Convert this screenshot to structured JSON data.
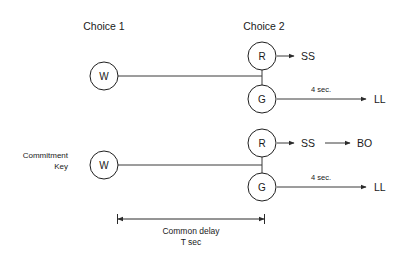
{
  "diagram": {
    "title_absent": true,
    "background_color": "#ffffff",
    "line_color": "#3b3b3b",
    "text_color": "#1a1a1a",
    "headers": {
      "choice1": "Choice 1",
      "choice2": "Choice 2"
    },
    "side_label": {
      "line1": "Commitment",
      "line2": "Key"
    },
    "nodes": {
      "w": "W",
      "r": "R",
      "g": "G"
    },
    "rows": [
      {
        "id": "row-top",
        "start_node": "W",
        "branch_upper": {
          "node": "R",
          "outcome": "SS",
          "delay": "",
          "secondary_outcome": ""
        },
        "branch_lower": {
          "node": "G",
          "outcome": "LL",
          "delay": "4 sec."
        }
      },
      {
        "id": "row-bottom",
        "start_node": "W",
        "branch_upper": {
          "node": "R",
          "outcome": "SS",
          "delay": "",
          "secondary_outcome": "BO"
        },
        "branch_lower": {
          "node": "G",
          "outcome": "LL",
          "delay": "4 sec."
        }
      }
    ],
    "dimension": {
      "caption_line1": "Common delay",
      "caption_line2": "T sec"
    }
  }
}
